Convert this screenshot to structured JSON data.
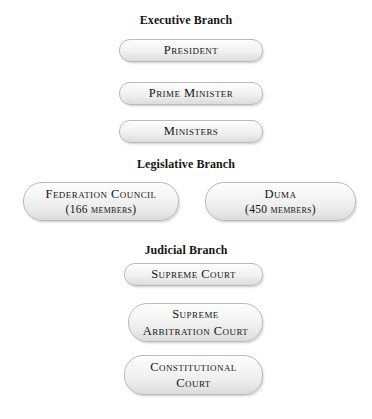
{
  "diagram": {
    "background_color": "#ffffff",
    "text_color": "#161616",
    "node_border_color": "#b9b9b9",
    "sections": [
      {
        "heading": "Executive Branch",
        "nodes": [
          {
            "lines": [
              "President"
            ]
          },
          {
            "lines": [
              "Prime Minister"
            ]
          },
          {
            "lines": [
              "Ministers"
            ]
          }
        ]
      },
      {
        "heading": "Legislative Branch",
        "nodes": [
          {
            "lines": [
              "Federation Council",
              "(166 members)"
            ]
          },
          {
            "lines": [
              "Duma",
              "(450 members)"
            ]
          }
        ]
      },
      {
        "heading": "Judicial Branch",
        "nodes": [
          {
            "lines": [
              "Supreme Court"
            ]
          },
          {
            "lines": [
              "Supreme",
              "Arbitration Court"
            ]
          },
          {
            "lines": [
              "Constitutional",
              "Court"
            ]
          }
        ]
      }
    ]
  }
}
